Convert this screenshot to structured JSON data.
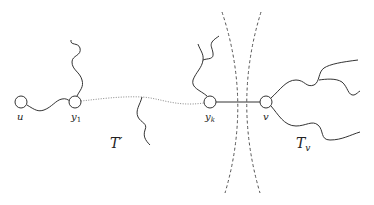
{
  "diagram": {
    "nodes": [
      {
        "id": "u",
        "label": "u",
        "sub": ""
      },
      {
        "id": "y1",
        "label": "y",
        "sub": "1"
      },
      {
        "id": "yk",
        "label": "y",
        "sub": "k"
      },
      {
        "id": "v",
        "label": "v",
        "sub": ""
      }
    ],
    "regions": [
      {
        "id": "T-prime",
        "label": "T′"
      },
      {
        "id": "T-v",
        "label": "T",
        "sub": "v"
      }
    ],
    "colors": {
      "stroke": "#333333",
      "dotted": "#888888",
      "dashed": "#555555"
    }
  }
}
